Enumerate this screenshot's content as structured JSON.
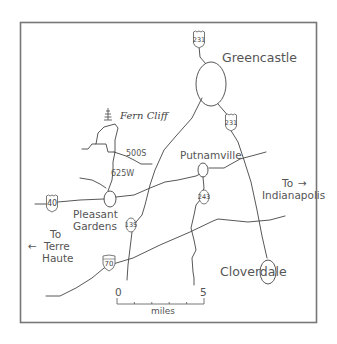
{
  "map": {
    "towns": {
      "greencastle": "Greencastle",
      "putnamville": "Putnamville",
      "pleasant_gardens_line1": "Pleasant",
      "pleasant_gardens_line2": "Gardens",
      "cloverdale": "Cloverdale"
    },
    "landmark": {
      "name": "Fern Cliff",
      "icon": "tree-icon"
    },
    "road_labels": {
      "r500s": "500S",
      "r625w": "625W"
    },
    "shields": {
      "us231_north": "231",
      "us231_south": "231",
      "us40": "40",
      "sr135": "135",
      "sr243": "243",
      "i70": "70"
    },
    "directions": {
      "east_line1": "To",
      "east_arrow": "→",
      "east_line2": "Indianapolis",
      "west_arrow": "←",
      "west_line1": "To",
      "west_line2": "Terre",
      "west_line3": "Haute"
    },
    "scale": {
      "start": "0",
      "end": "5",
      "unit": "miles"
    }
  }
}
